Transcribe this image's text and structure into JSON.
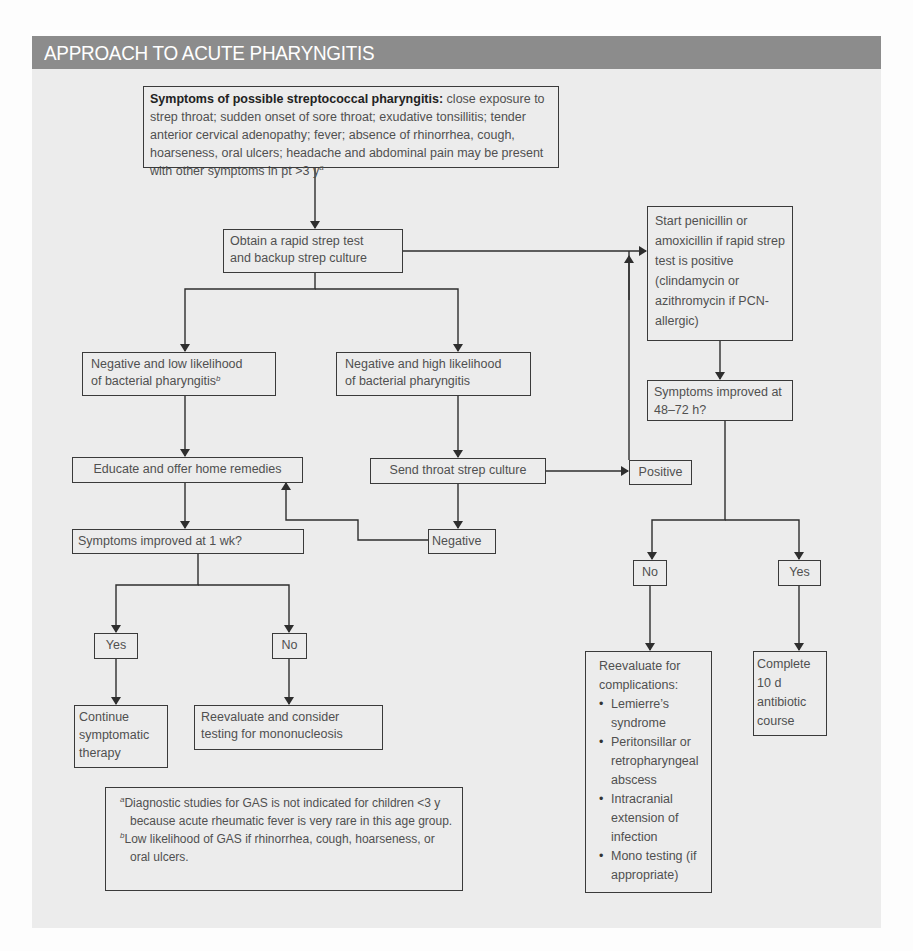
{
  "title": "APPROACH TO ACUTE PHARYNGITIS",
  "colors": {
    "title_bar": "#8c8c8c",
    "panel_bg": "#ececec",
    "line": "#2e2e2e",
    "text": "#505050"
  },
  "nodes": {
    "symptoms": {
      "bold_label": "Symptoms of possible streptococcal pharyngitis:",
      "text": " close exposure to strep throat; sudden onset of sore throat; exudative tonsillitis; tender anterior cervical adenopathy; fever; absence of rhinorrhea, cough, hoarseness, oral ulcers; headache and abdominal pain may be present with other symptoms in pt >3 y",
      "footnote_ref": "a"
    },
    "obtain_test": {
      "line1": "Obtain a rapid strep test",
      "line2": "and backup strep culture"
    },
    "start_antibiotics": {
      "text": "Start penicillin or amoxicillin if rapid strep test is positive (clindamycin or azithromycin if PCN-allergic)"
    },
    "neg_low": {
      "line1": "Negative and low likelihood",
      "line2": "of bacterial pharyngitis",
      "footnote_ref": "b"
    },
    "neg_high": {
      "line1": "Negative and high likelihood",
      "line2": "of bacterial pharyngitis"
    },
    "improved_48_72": {
      "text": "Symptoms improved at 48–72 h?"
    },
    "educate": {
      "text": "Educate and offer home remedies"
    },
    "send_culture": {
      "text": "Send throat strep culture"
    },
    "positive": {
      "text": "Positive"
    },
    "improved_1wk": {
      "text": "Symptoms improved at 1 wk?"
    },
    "negative": {
      "text": "Negative"
    },
    "no_right": {
      "text": "No"
    },
    "yes_right": {
      "text": "Yes"
    },
    "yes_left": {
      "text": "Yes"
    },
    "no_left": {
      "text": "No"
    },
    "continue_therapy": {
      "text": "Continue symptomatic therapy"
    },
    "reevaluate_mono": {
      "line1": "Reevaluate and consider",
      "line2": "testing for mononucleosis"
    },
    "reevaluate_complications": {
      "heading": "Reevaluate for complications:",
      "items": [
        "Lemierre’s syndrome",
        "Peritonsillar or retropharyngeal abscess",
        "Intracranial extension of infection",
        "Mono testing (if appropriate)"
      ]
    },
    "complete_course": {
      "text": "Complete 10 d antibiotic course"
    }
  },
  "footnotes": [
    {
      "mark": "a",
      "text": "Diagnostic studies for GAS is not indicated for children <3 y because acute rheumatic fever is very rare in this age group."
    },
    {
      "mark": "b",
      "text": "Low likelihood of GAS if rhinorrhea, cough, hoarseness, or oral ulcers."
    }
  ]
}
